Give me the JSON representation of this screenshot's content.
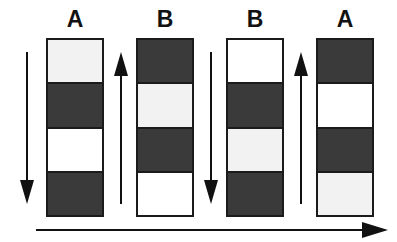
{
  "figure": {
    "title": "",
    "background_color": "#ffffff",
    "dark_color": "#3a3a3a",
    "light_color": "#f2f2f2",
    "white_color": "#ffffff",
    "outline_color": "#1b1b1b"
  },
  "columns": [
    {
      "label": "A",
      "x": 46,
      "segments": [
        "light",
        "dark",
        "white",
        "dark"
      ]
    },
    {
      "label": "B",
      "x": 136,
      "segments": [
        "dark",
        "light",
        "dark",
        "white"
      ]
    },
    {
      "label": "B",
      "x": 226,
      "segments": [
        "white",
        "dark",
        "light",
        "dark"
      ]
    },
    {
      "label": "A",
      "x": 316,
      "segments": [
        "dark",
        "white",
        "dark",
        "light"
      ]
    }
  ],
  "vertical_arrows": [
    {
      "name": "arrow-down-1",
      "direction": "down",
      "x": 16
    },
    {
      "name": "arrow-up-1",
      "direction": "up",
      "x": 110
    },
    {
      "name": "arrow-down-2",
      "direction": "down",
      "x": 200
    },
    {
      "name": "arrow-up-2",
      "direction": "up",
      "x": 290
    }
  ],
  "bottom_arrow": {
    "name": "arrow-right",
    "direction": "right",
    "label": ""
  }
}
